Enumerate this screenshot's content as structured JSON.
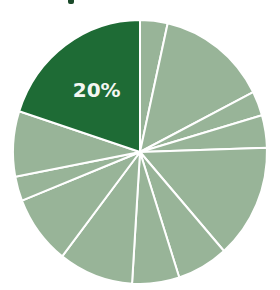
{
  "chart_data": {
    "type": "pie",
    "title": "",
    "start_angle_deg": 0,
    "direction": "clockwise",
    "categories": [
      "Slice 1",
      "Slice 2",
      "Slice 3",
      "Slice 4",
      "Slice 5",
      "Slice 6",
      "Slice 7",
      "Slice 8",
      "Slice 9",
      "Slice 10",
      "Slice 11",
      "Highlighted slice"
    ],
    "values": [
      3.5,
      14,
      3,
      4,
      14,
      6.5,
      6,
      9.5,
      8.5,
      3,
      8,
      20
    ],
    "highlight_index": 11,
    "labels": [
      "",
      "",
      "",
      "",
      "",
      "",
      "",
      "",
      "",
      "",
      "",
      "20%"
    ],
    "colors": {
      "highlight": "#1e6b35",
      "default": "#98b498",
      "separator": "#ffffff",
      "label_text": "#f4f7f2"
    },
    "legend": null
  }
}
